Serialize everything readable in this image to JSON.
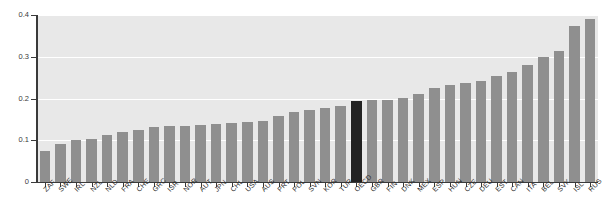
{
  "chart_data": {
    "type": "bar",
    "title": "",
    "subtitle": "",
    "xlabel": "",
    "ylabel": "",
    "ylim": [
      0,
      0.4
    ],
    "yticks": [
      "0",
      "0.1",
      "0.2",
      "0.3",
      "0.4"
    ],
    "ytick_values": [
      0,
      0.1,
      0.2,
      0.3,
      0.4
    ],
    "grid": true,
    "legend": "none",
    "highlight_category": "OECD",
    "bar_color": "#8f8f8f",
    "highlight_color": "#222222",
    "plot_background": "#e8e8e8",
    "categories": [
      "ZAF",
      "SWE",
      "IRL",
      "NZL",
      "NLD",
      "FRA",
      "CHE",
      "GRC",
      "ISR",
      "NOR",
      "AUT",
      "JPN",
      "CHL",
      "USA",
      "AUS",
      "PRT",
      "POL",
      "SVN",
      "KOR",
      "TUR",
      "OECD",
      "GBR",
      "FIN",
      "DNK",
      "MEX",
      "ESP",
      "HUN",
      "CZE",
      "DEU",
      "EST",
      "CAN",
      "ITA",
      "BEL",
      "SVK",
      "ISL",
      "RUS"
    ],
    "values": [
      0.075,
      0.09,
      0.101,
      0.104,
      0.112,
      0.12,
      0.124,
      0.131,
      0.134,
      0.134,
      0.137,
      0.138,
      0.141,
      0.143,
      0.146,
      0.157,
      0.168,
      0.172,
      0.177,
      0.181,
      0.195,
      0.197,
      0.197,
      0.202,
      0.212,
      0.224,
      0.232,
      0.237,
      0.242,
      0.254,
      0.263,
      0.281,
      0.3,
      0.315,
      0.373,
      0.39
    ]
  }
}
